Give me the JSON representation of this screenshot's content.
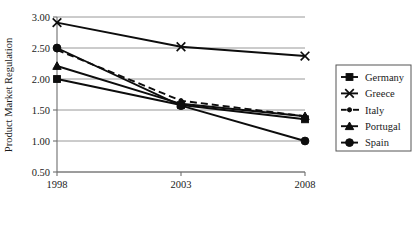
{
  "chart_data": {
    "type": "line",
    "title": "",
    "xlabel": "",
    "ylabel": "Product Market Regulation",
    "x": [
      "1998",
      "2003",
      "2008"
    ],
    "categories": [
      "1998",
      "2003",
      "2008"
    ],
    "xtick_labels": [
      "1998",
      "2003",
      "2008"
    ],
    "ytick_labels": [
      "0.50",
      "1.00",
      "1.50",
      "2.00",
      "2.50",
      "3.00"
    ],
    "ytick_values": [
      0.5,
      1.0,
      1.5,
      2.0,
      2.5,
      3.0
    ],
    "ylim": [
      0.5,
      3.0
    ],
    "grid": "horizontal",
    "legend_position": "right",
    "series": [
      {
        "name": "Germany",
        "marker": "filled-square",
        "linestyle": "solid",
        "values": [
          2.0,
          1.58,
          1.35
        ]
      },
      {
        "name": "Greece",
        "marker": "cross-x",
        "linestyle": "solid",
        "values": [
          2.91,
          2.52,
          2.37
        ]
      },
      {
        "name": "Italy",
        "marker": "small-dot",
        "linestyle": "dashed",
        "values": [
          2.47,
          1.65,
          1.4
        ]
      },
      {
        "name": "Portugal",
        "marker": "filled-triangle",
        "linestyle": "solid",
        "values": [
          2.21,
          1.6,
          1.4
        ]
      },
      {
        "name": "Spain",
        "marker": "filled-circle",
        "linestyle": "solid",
        "values": [
          2.5,
          1.57,
          1.0
        ]
      }
    ]
  },
  "axis": {
    "y_title": "Product Market Regulation",
    "y_ticks": [
      {
        "label": "3.00",
        "value": 3.0
      },
      {
        "label": "2.50",
        "value": 2.5
      },
      {
        "label": "2.00",
        "value": 2.0
      },
      {
        "label": "1.50",
        "value": 1.5
      },
      {
        "label": "1.00",
        "value": 1.0
      },
      {
        "label": "0.50",
        "value": 0.5
      }
    ],
    "x_ticks": [
      {
        "label": "1998",
        "value": 1998
      },
      {
        "label": "2003",
        "value": 2003
      },
      {
        "label": "2008",
        "value": 2008
      }
    ]
  },
  "legend": {
    "entries": [
      {
        "label": "Germany",
        "marker": "filled-square",
        "linestyle": "solid"
      },
      {
        "label": "Greece",
        "marker": "cross-x",
        "linestyle": "solid"
      },
      {
        "label": "Italy",
        "marker": "small-dot",
        "linestyle": "dashed"
      },
      {
        "label": "Portugal",
        "marker": "filled-triangle",
        "linestyle": "solid"
      },
      {
        "label": "Spain",
        "marker": "filled-circle",
        "linestyle": "solid"
      }
    ]
  },
  "colors": {
    "series": "#0d0d0d",
    "gridline": "#8c8c8c",
    "axis": "#6e6e6e",
    "background": "#ffffff",
    "text": "#1a1a1a"
  }
}
